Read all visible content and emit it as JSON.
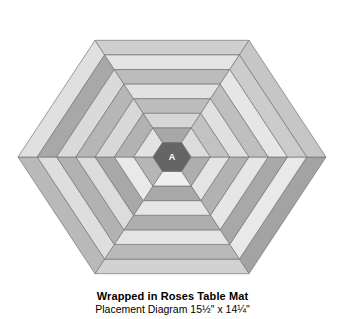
{
  "page": {
    "background_color": "#ffffff",
    "width": 345,
    "height": 319
  },
  "caption": {
    "title": "Wrapped in Roses Table Mat",
    "subtitle": "Placement Diagram 15½\" x 14¼\""
  },
  "diagram": {
    "type": "hexagon-log-cabin-placement-diagram",
    "center_label": "A",
    "center_fill": "#656565",
    "stroke_color": "#777777",
    "stroke_width": 0.7,
    "geometry": {
      "center_x": 172,
      "center_y": 157,
      "outer_radius": 154,
      "hex_orientation": "flat-left-right-vertices",
      "ring_count": 7,
      "strips_per_ring": 6,
      "core_radius": 19
    },
    "fills": {
      "light": "#e9e9e9",
      "medium": "#b9b9b9",
      "dark_medium": "#a3a3a3",
      "pale": "#dcdcdc"
    },
    "rings": [
      {
        "index": 0,
        "name": "ring-outer-1",
        "strip_colors": [
          "#a3a3a3",
          "#d2d2d2",
          "#b9b9b9",
          "#e0e0e0",
          "#cfcfcf",
          "#c6c6c6"
        ]
      },
      {
        "index": 1,
        "name": "ring-2",
        "strip_colors": [
          "#e9e9e9",
          "#b9b9b9",
          "#dedede",
          "#a8a8a8",
          "#e4e4e4",
          "#cccccc"
        ]
      },
      {
        "index": 2,
        "name": "ring-3",
        "strip_colors": [
          "#a8a8a8",
          "#e4e4e4",
          "#b2b2b2",
          "#dadada",
          "#bcbcbc",
          "#e6e6e6"
        ]
      },
      {
        "index": 3,
        "name": "ring-4",
        "strip_colors": [
          "#e6e6e6",
          "#aeaeae",
          "#dcdcdc",
          "#b6b6b6",
          "#e2e2e2",
          "#bfbfbf"
        ]
      },
      {
        "index": 4,
        "name": "ring-5",
        "strip_colors": [
          "#b2b2b2",
          "#e6e6e6",
          "#a8a8a8",
          "#d8d8d8",
          "#bcbcbc",
          "#e0e0e0"
        ]
      },
      {
        "index": 5,
        "name": "ring-6",
        "strip_colors": [
          "#e4e4e4",
          "#a8a8a8",
          "#e9e9e9",
          "#b2b2b2",
          "#d6d6d6",
          "#c2c2c2"
        ]
      },
      {
        "index": 6,
        "name": "ring-inner-7",
        "strip_colors": [
          "#aeaeae",
          "#efefef",
          "#b6b6b6",
          "#e2e2e2",
          "#a8a8a8",
          "#dcdcdc"
        ]
      }
    ]
  }
}
